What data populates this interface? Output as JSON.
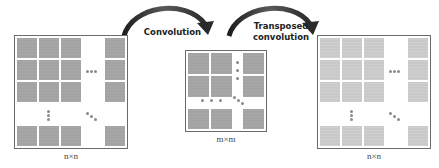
{
  "diagram": {
    "type": "convolution-transposed-convolution",
    "colors": {
      "input_cell": "#a3a3a3",
      "output_cell": "#c9c9c9",
      "border": "#6a6a6a",
      "arrow": "#3a3a3a",
      "dots": "#8a8a8a"
    },
    "input_matrix": {
      "label": "n×n"
    },
    "middle_matrix": {
      "label": "m×m"
    },
    "output_matrix": {
      "label": "n×n"
    },
    "arrows": [
      {
        "label": "Convolution",
        "from": "input_matrix",
        "to": "middle_matrix"
      },
      {
        "label_line1": "Transposed",
        "label_line2": "convolution",
        "from": "middle_matrix",
        "to": "output_matrix"
      }
    ]
  }
}
